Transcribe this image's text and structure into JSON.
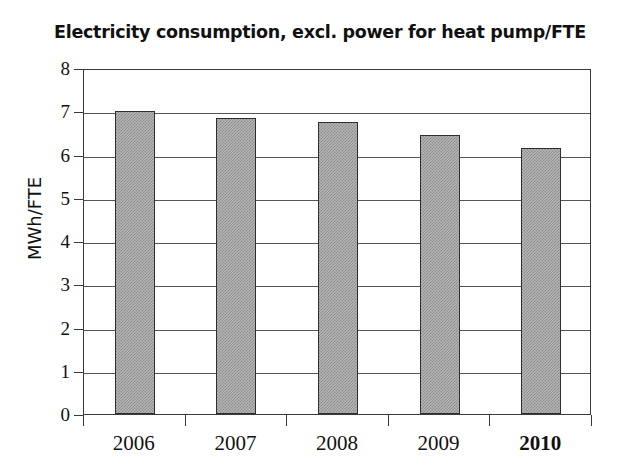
{
  "chart_data": {
    "type": "bar",
    "title": "Electricity consumption, excl. power for heat pump/FTE",
    "xlabel": "",
    "ylabel": "MWh/FTE",
    "categories": [
      "2006",
      "2007",
      "2008",
      "2009",
      "2010"
    ],
    "values": [
      7.0,
      6.85,
      6.75,
      6.45,
      6.15
    ],
    "ylim": [
      0,
      8
    ],
    "ytick_labels": [
      "0",
      "1",
      "2",
      "3",
      "4",
      "5",
      "6",
      "7",
      "8"
    ],
    "ytick_values": [
      0,
      1,
      2,
      3,
      4,
      5,
      6,
      7,
      8
    ],
    "grid": true,
    "grid_axis": "y",
    "legend": null,
    "legend_position": "none",
    "highlighted_category": "2010",
    "bar_fill_color": "#b4b4b4",
    "bar_edge_color": "#2e2e2e",
    "gridline_color": "#55565a",
    "axis_color": "#3a3a3a",
    "text_color": "#111111",
    "background_color": "#ffffff"
  }
}
